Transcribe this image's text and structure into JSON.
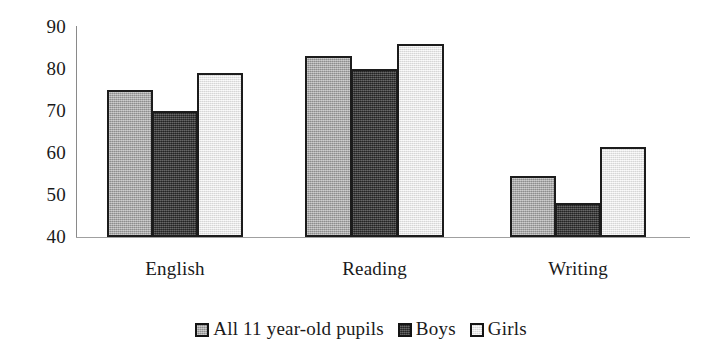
{
  "chart_data": {
    "type": "bar",
    "title": "",
    "subtitle": "",
    "xlabel": "",
    "ylabel": "",
    "categories": [
      "English",
      "Reading",
      "Writing"
    ],
    "series": [
      {
        "name": "All 11 year-old pupils",
        "values": [
          75,
          83,
          54.5
        ],
        "color": "#a9a9a9"
      },
      {
        "name": "Boys",
        "values": [
          70,
          80,
          48
        ],
        "color": "#3a3a3a"
      },
      {
        "name": "Girls",
        "values": [
          79,
          86,
          61.5
        ],
        "color": "#ececec"
      }
    ],
    "ylim": [
      40,
      90
    ],
    "yticks": [
      40,
      50,
      60,
      70,
      80,
      90
    ],
    "ytick_labels": [
      "40",
      "50",
      "60",
      "70",
      "80",
      "90"
    ],
    "grid": false,
    "legend_position": "bottom",
    "bar_edge_color": "#1c1c1c",
    "axis_color": "#8a8a8a",
    "background": "#ffffff"
  },
  "axis": {
    "ticks": [
      {
        "label": "90",
        "value": 90
      },
      {
        "label": "80",
        "value": 80
      },
      {
        "label": "70",
        "value": 70
      },
      {
        "label": "60",
        "value": 60
      },
      {
        "label": "50",
        "value": 50
      },
      {
        "label": "40",
        "value": 40
      }
    ]
  },
  "categories": [
    {
      "label": "English"
    },
    {
      "label": "Reading"
    },
    {
      "label": "Writing"
    }
  ],
  "legend": {
    "items": [
      {
        "label": "All 11 year-old pupils",
        "swatch": "#a9a9a9"
      },
      {
        "label": "Boys",
        "swatch": "#3a3a3a"
      },
      {
        "label": "Girls",
        "swatch": "#ececec"
      }
    ]
  }
}
